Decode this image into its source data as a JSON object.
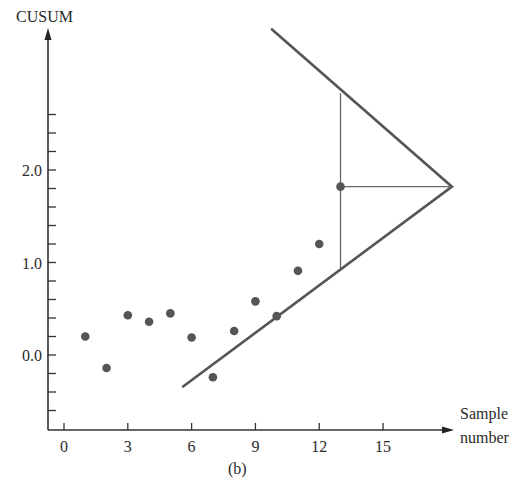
{
  "chart_data": {
    "type": "scatter",
    "title": "",
    "subtitle": "",
    "caption": "(b)",
    "xlabel": "Sample number",
    "xlabel_lines": [
      "Sample",
      "number"
    ],
    "ylabel": "CUSUM",
    "x_ticks": [
      0,
      3,
      6,
      9,
      12,
      15
    ],
    "x_tick_labels": [
      "0",
      "3",
      "6",
      "9",
      "12",
      "15"
    ],
    "y_major_ticks": [
      0.0,
      1.0,
      2.0
    ],
    "y_tick_labels": [
      "0.0",
      "1.0",
      "2.0"
    ],
    "y_minor_tick_step": 0.2,
    "xlim": [
      -0.8,
      18.5
    ],
    "ylim": [
      -0.8,
      3.4
    ],
    "grid": false,
    "legend": null,
    "series": [
      {
        "name": "CUSUM",
        "marker": "circle",
        "color": "#555555",
        "points": [
          {
            "x": 1,
            "y": 0.2
          },
          {
            "x": 2,
            "y": -0.14
          },
          {
            "x": 3,
            "y": 0.43
          },
          {
            "x": 4,
            "y": 0.36
          },
          {
            "x": 5,
            "y": 0.45
          },
          {
            "x": 6,
            "y": 0.19
          },
          {
            "x": 7,
            "y": -0.24
          },
          {
            "x": 8,
            "y": 0.26
          },
          {
            "x": 9,
            "y": 0.58
          },
          {
            "x": 10,
            "y": 0.42
          },
          {
            "x": 11,
            "y": 0.91
          },
          {
            "x": 12,
            "y": 1.2
          },
          {
            "x": 13,
            "y": 1.82
          }
        ]
      }
    ],
    "annotations": {
      "v_mask": {
        "vertex": {
          "x": 18.24,
          "y": 1.82
        },
        "upper_arm_end": {
          "x": 9.78,
          "y": 3.52
        },
        "lower_arm_end": {
          "x": 5.6,
          "y": -0.34
        },
        "color": "#555555"
      },
      "lead_distance_line": {
        "from": {
          "x": 13,
          "y": 1.82
        },
        "to": {
          "x": 18.24,
          "y": 1.82
        }
      },
      "vertical_span_line": {
        "x": 13,
        "y_from": 0.94,
        "y_to": 2.83
      }
    }
  },
  "axes": {
    "y_label": "CUSUM",
    "x_label_line1": "Sample",
    "x_label_line2": "number",
    "caption": "(b)"
  }
}
